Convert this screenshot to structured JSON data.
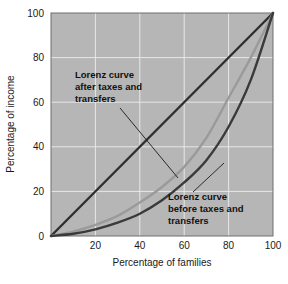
{
  "chart_data": {
    "type": "line",
    "title": "",
    "xlabel": "Percentage of families",
    "ylabel": "Percentage of income",
    "xlim": [
      0,
      100
    ],
    "ylim": [
      0,
      100
    ],
    "xticks": [
      "20",
      "40",
      "60",
      "80",
      "100"
    ],
    "xtick_values": [
      20,
      40,
      60,
      80,
      100
    ],
    "yticks": [
      "0",
      "20",
      "40",
      "60",
      "80",
      "100"
    ],
    "ytick_values": [
      0,
      20,
      40,
      60,
      80,
      100
    ],
    "grid": true,
    "grid_color": "#e8e8e8",
    "plot_background": "#b6b6b6",
    "legend_position": "none",
    "series": [
      {
        "name": "Line of perfect equality",
        "color": "#2f2f2f",
        "x": [
          0,
          100
        ],
        "values": [
          0,
          100
        ]
      },
      {
        "name": "Lorenz curve after taxes and transfers",
        "color": "#9a9a9a",
        "x": [
          0,
          10,
          20,
          30,
          40,
          50,
          60,
          70,
          80,
          90,
          100
        ],
        "values": [
          0,
          2,
          5,
          9,
          15,
          22,
          31,
          44,
          62,
          80,
          100
        ]
      },
      {
        "name": "Lorenz curve before taxes and transfers",
        "color": "#3a3a3a",
        "x": [
          0,
          10,
          20,
          30,
          40,
          50,
          60,
          70,
          80,
          90,
          100
        ],
        "values": [
          0,
          1,
          3,
          6,
          10,
          16,
          24,
          34,
          49,
          70,
          100
        ]
      }
    ],
    "annotations": [
      {
        "name": "after-taxes-annotation",
        "lines": [
          "Lorenz curve",
          "after taxes and",
          "transfers"
        ],
        "text_x": 75,
        "text_y": 78,
        "leader_from_x": 120,
        "leader_from_y": 108,
        "leader_to_x": 178,
        "leader_to_y": 178
      },
      {
        "name": "before-taxes-annotation",
        "lines": [
          "Lorenz curve",
          "before taxes and",
          "transfers"
        ],
        "text_x": 168,
        "text_y": 200,
        "leader_from_x": 193,
        "leader_from_y": 192,
        "leader_to_x": 224,
        "leader_to_y": 163
      }
    ]
  }
}
